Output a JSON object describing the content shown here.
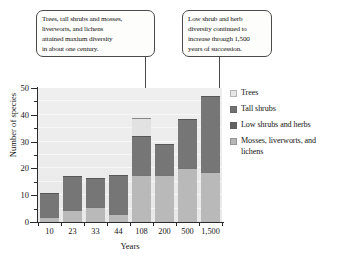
{
  "chart_data": {
    "type": "bar",
    "subtype": "stacked-bar",
    "title": "",
    "xlabel": "Years",
    "ylabel": "Number of species",
    "categories": [
      "10",
      "23",
      "33",
      "44",
      "108",
      "200",
      "500",
      "1,500"
    ],
    "ylim": [
      0,
      50
    ],
    "yticks": [
      0,
      10,
      20,
      30,
      40,
      50
    ],
    "ytick_labels": [
      "0",
      "10",
      "20",
      "30",
      "40",
      "50"
    ],
    "yminorticks": [
      5,
      15,
      25,
      35,
      45
    ],
    "grid": true,
    "legend_position": "right",
    "series": [
      {
        "name": "Mosses, liverworts, and lichens",
        "color": "#b9b9b9",
        "values": [
          2,
          4.5,
          5.5,
          3,
          17.5,
          17.5,
          20,
          18.5
        ]
      },
      {
        "name": "Low shrubs and herbs",
        "color": "#6e6e6e",
        "values": [
          0,
          0,
          0,
          0,
          0,
          0,
          0,
          0
        ]
      },
      {
        "name": "Tall shrubs",
        "color": "#767676",
        "values": [
          9,
          12.5,
          11,
          14.5,
          14.5,
          11.5,
          18.5,
          28.5
        ]
      },
      {
        "name": "Trees",
        "color": "#e2e2e2",
        "values": [
          0,
          0,
          0,
          0,
          7,
          0,
          0,
          0
        ]
      }
    ],
    "totals": [
      11,
      17,
      16.5,
      17.5,
      39,
      29,
      38.5,
      47
    ],
    "annotations": [
      {
        "text": "Trees, tall shrubs and mosses, liverworts, and lichens attained maxium diversity in about one century.",
        "points_to": "108"
      },
      {
        "text": "Low shrub and herb diversity continued to increase through 1,500 years of succession.",
        "points_to": "1,500"
      }
    ]
  },
  "callouts": [
    {
      "id": "callout-1",
      "lines": [
        "Trees, tall shrubs and mosses,",
        "liverworts, and lichens",
        "attained maxium diversity",
        "in about one century."
      ]
    },
    {
      "id": "callout-2",
      "lines": [
        "Low shrub and herb",
        "diversity continued to",
        "increase through 1,500",
        "years of succession."
      ]
    }
  ],
  "axes": {
    "y_title": "Number of species",
    "x_title": "Years"
  },
  "legend": {
    "items": [
      {
        "label": "Trees",
        "color": "#e6e6e6"
      },
      {
        "label": "Tall shrubs",
        "color": "#707070"
      },
      {
        "label": "Low shrubs and herbs",
        "color": "#616161"
      },
      {
        "label": "Mosses, liverworts, and lichens",
        "color": "#b5b5b5"
      }
    ]
  },
  "colors": {
    "plot_background": "#ededed",
    "axis": "#2a2a2a",
    "callout_border": "#4a4a4a",
    "callout_background": "#fdfdfb"
  }
}
